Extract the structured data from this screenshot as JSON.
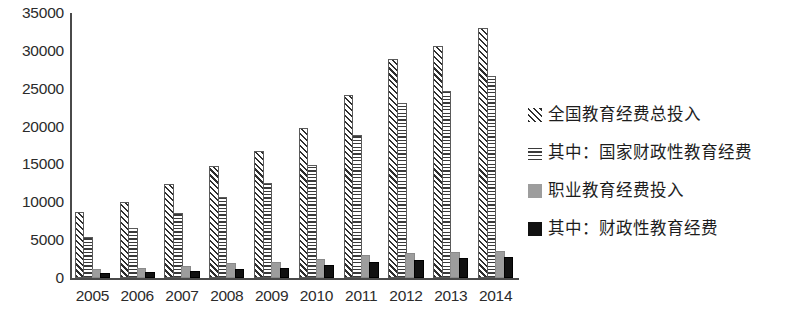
{
  "chart_data": {
    "type": "bar",
    "title": "",
    "subtitle": "",
    "xlabel": "",
    "ylabel": "",
    "categories": [
      "2005",
      "2006",
      "2007",
      "2008",
      "2009",
      "2010",
      "2011",
      "2012",
      "2013",
      "2014"
    ],
    "ylim": [
      0,
      35000
    ],
    "yticks": [
      0,
      5000,
      10000,
      15000,
      20000,
      25000,
      30000,
      35000
    ],
    "ytick_labels": [
      "0",
      "5000",
      "10000",
      "15000",
      "20000",
      "25000",
      "30000",
      "35000"
    ],
    "grid": false,
    "legend_position": "right",
    "series": [
      {
        "name": "全国教育经费总投入",
        "pattern": "diagonal-hatch",
        "color": "#2e2e2e",
        "values": [
          8419,
          9815,
          12148,
          14500,
          16503,
          19562,
          23869,
          28655,
          30365,
          32806
        ]
      },
      {
        "name": "其中：国家财政性教育经费",
        "pattern": "horizontal-hatch",
        "color": "#3a3a3a",
        "values": [
          5161,
          6348,
          8280,
          10450,
          12231,
          14670,
          18587,
          22906,
          24488,
          26420
        ]
      },
      {
        "name": "职业教育经费投入",
        "pattern": "solid",
        "color": "#9d9d9d",
        "values": [
          942,
          1089,
          1354,
          1692,
          1892,
          2254,
          2751,
          3076,
          3219,
          3345
        ]
      },
      {
        "name": "其中：财政性教育经费",
        "pattern": "solid",
        "color": "#111111",
        "values": [
          380,
          468,
          633,
          911,
          1109,
          1413,
          1800,
          2129,
          2363,
          2568
        ]
      }
    ]
  },
  "legend": {
    "items": [
      {
        "label": "全国教育经费总投入",
        "swatch": "diagonal-hatch-swatch"
      },
      {
        "label": "其中：国家财政性教育经费",
        "swatch": "horizontal-hatch-swatch"
      },
      {
        "label": "职业教育经费投入",
        "swatch": "gray-solid-swatch"
      },
      {
        "label": "其中：财政性教育经费",
        "swatch": "black-solid-swatch"
      }
    ]
  }
}
